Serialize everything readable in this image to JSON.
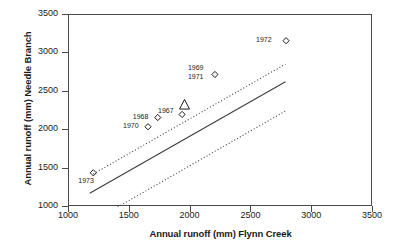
{
  "chart_data": {
    "type": "scatter",
    "title": "",
    "xlabel": "Annual runoff (mm) Flynn Creek",
    "ylabel": "Annual runoff (mm) Needle Branch",
    "xlim": [
      1000,
      3500
    ],
    "ylim": [
      1000,
      3500
    ],
    "xticks": [
      1000,
      1500,
      2000,
      2500,
      3000,
      3500
    ],
    "yticks": [
      1000,
      1500,
      2000,
      2500,
      3000,
      3500
    ],
    "xtick_labels": [
      "1000",
      "1500",
      "2000",
      "2500",
      "3000",
      "3500"
    ],
    "ytick_labels": [
      "1000",
      "1500",
      "2000",
      "2500",
      "3000",
      "3500"
    ],
    "grid": false,
    "legend": false,
    "points": [
      {
        "label": "1973",
        "x": 1200,
        "y": 1445,
        "marker": "open-diamond",
        "label_dx": -14,
        "label_dy": 9
      },
      {
        "label": "1970",
        "x": 1650,
        "y": 2045,
        "marker": "open-diamond",
        "label_dx": -24,
        "label_dy": 0
      },
      {
        "label": "1968",
        "x": 1730,
        "y": 2165,
        "marker": "open-diamond",
        "label_dx": -24,
        "label_dy": 0
      },
      {
        "label": "1967",
        "x": 1930,
        "y": 2205,
        "marker": "open-diamond",
        "label_dx": -23,
        "label_dy": -2
      },
      {
        "label": "1969",
        "x": 2200,
        "y": 2725,
        "marker": "open-diamond",
        "label_dx": -26,
        "label_dy": -6
      },
      {
        "label": "1971",
        "x": 2200,
        "y": 2725,
        "marker": "open-diamond",
        "label_dx": -26,
        "label_dy": 3
      },
      {
        "label": "1972",
        "x": 2785,
        "y": 3165,
        "marker": "open-diamond",
        "label_dx": -29,
        "label_dy": 0
      }
    ],
    "special_marker": {
      "label": "mean",
      "x": 1950,
      "y": 2330,
      "marker": "open-triangle"
    },
    "lines": [
      {
        "name": "regression-line",
        "style": "solid",
        "x": [
          1170,
          2780
        ],
        "y": [
          1180,
          2630
        ]
      },
      {
        "name": "upper-confidence-band",
        "style": "dotted",
        "x": [
          1200,
          2780
        ],
        "y": [
          1430,
          2860
        ]
      },
      {
        "name": "lower-confidence-band",
        "style": "dotted",
        "x": [
          1400,
          2780
        ],
        "y": [
          1000,
          2250
        ]
      }
    ]
  },
  "colors": {
    "axis": "#4a4a4a",
    "line": "#3c3c3c",
    "marker": "#1a1a1a",
    "text": "#1a1a1a",
    "background": "#ffffff"
  }
}
